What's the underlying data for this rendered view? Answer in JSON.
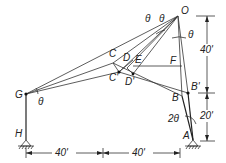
{
  "diagram": {
    "type": "structural-frame-displacement",
    "points": {
      "O": {
        "label": "O",
        "x": 178,
        "y": 16
      },
      "G": {
        "label": "G",
        "x": 26,
        "y": 94
      },
      "H": {
        "label": "H",
        "x": 26,
        "y": 140
      },
      "A": {
        "label": "A",
        "x": 193,
        "y": 140
      },
      "B": {
        "label": "B",
        "x": 182,
        "y": 96
      },
      "B_prime": {
        "label": "B'",
        "x": 188,
        "y": 93
      },
      "C": {
        "label": "C",
        "x": 113,
        "y": 63
      },
      "C_prime": {
        "label": "C'",
        "x": 119,
        "y": 72
      },
      "D": {
        "label": "D",
        "x": 127,
        "y": 63
      },
      "E": {
        "label": "E",
        "x": 137,
        "y": 63
      },
      "D_prime": {
        "label": "D'",
        "x": 133,
        "y": 74
      },
      "F": {
        "label": "F",
        "x": 175,
        "y": 66
      }
    },
    "angle_labels": {
      "theta": "θ",
      "two_theta": "2θ"
    },
    "dimensions": {
      "vertical_upper": "40'",
      "vertical_lower": "20'",
      "horizontal_left": "40'",
      "horizontal_right": "40'"
    }
  }
}
